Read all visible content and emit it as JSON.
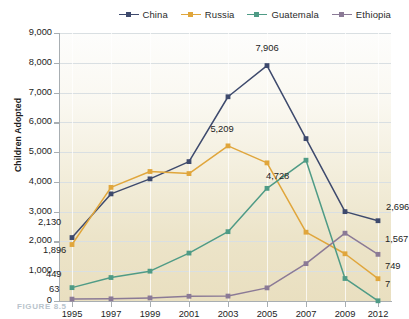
{
  "chart_data": {
    "type": "line",
    "title": "",
    "xlabel": "",
    "ylabel": "Children Adopted",
    "categories": [
      "1995",
      "1997",
      "1999",
      "2001",
      "2003",
      "2005",
      "2007",
      "2009",
      "2012"
    ],
    "ylim": [
      0,
      9000
    ],
    "ytick_labels": [
      "0",
      "1,000",
      "2,000",
      "3,000",
      "4,000",
      "5,000",
      "6,000",
      "7,000",
      "8,000",
      "9,000"
    ],
    "ytick_values": [
      0,
      1000,
      2000,
      3000,
      4000,
      5000,
      6000,
      7000,
      8000,
      9000
    ],
    "grid": true,
    "legend_position": "top-right",
    "series": [
      {
        "name": "China",
        "color": "#3e4a6d",
        "values": [
          2130,
          3597,
          4101,
          4681,
          6859,
          7906,
          5453,
          3001,
          2696
        ],
        "labels": [
          {
            "index": 0,
            "text": "2,130"
          },
          {
            "index": 5,
            "text": "7,906"
          },
          {
            "index": 8,
            "text": "2,696"
          }
        ]
      },
      {
        "name": "Russia",
        "color": "#e0a63c",
        "values": [
          1896,
          3816,
          4348,
          4279,
          5209,
          4639,
          2310,
          1586,
          749
        ],
        "labels": [
          {
            "index": 0,
            "text": "1,896"
          },
          {
            "index": 4,
            "text": "5,209"
          },
          {
            "index": 8,
            "text": "749"
          }
        ]
      },
      {
        "name": "Guatemala",
        "color": "#4f9b86",
        "values": [
          449,
          788,
          1002,
          1609,
          2328,
          3783,
          4728,
          756,
          7
        ],
        "labels": [
          {
            "index": 0,
            "text": "449"
          },
          {
            "index": 6,
            "text": "4,728"
          },
          {
            "index": 8,
            "text": "7"
          }
        ]
      },
      {
        "name": "Ethiopia",
        "color": "#8b7a96",
        "values": [
          63,
          72,
          103,
          158,
          165,
          441,
          1255,
          2277,
          1567
        ],
        "labels": [
          {
            "index": 0,
            "text": "63"
          },
          {
            "index": 8,
            "text": "1,567"
          }
        ]
      }
    ]
  },
  "legend": {
    "items": [
      {
        "label": "China",
        "color": "#3e4a6d"
      },
      {
        "label": "Russia",
        "color": "#e0a63c"
      },
      {
        "label": "Guatemala",
        "color": "#4f9b86"
      },
      {
        "label": "Ethiopia",
        "color": "#8b7a96"
      }
    ]
  },
  "caption": {
    "text": "FIGURE 8.5"
  }
}
